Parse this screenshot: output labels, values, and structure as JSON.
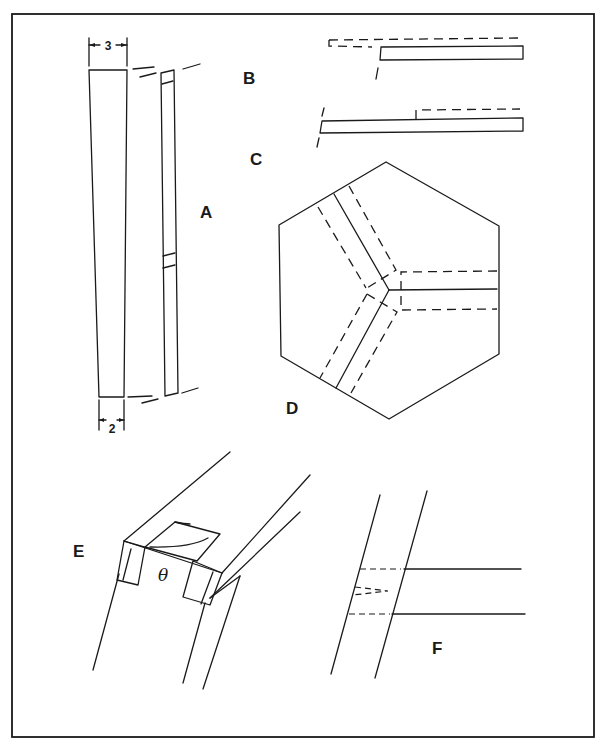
{
  "figure": {
    "panels": [
      {
        "id": "A",
        "label": "A",
        "description": "Tapered stave, front and side views"
      },
      {
        "id": "B",
        "label": "B",
        "description": "Offset strip joint"
      },
      {
        "id": "C",
        "label": "C",
        "description": "Stepped strip joint"
      },
      {
        "id": "D",
        "label": "D",
        "description": "Hexagonal plate with three radial strips"
      },
      {
        "id": "E",
        "label": "E",
        "description": "Notched beam end in perspective"
      },
      {
        "id": "F",
        "label": "F",
        "description": "Angled strip junction"
      }
    ],
    "dimensions": {
      "top_width": "3",
      "bottom_width": "2"
    },
    "angle_symbol": "θ"
  }
}
